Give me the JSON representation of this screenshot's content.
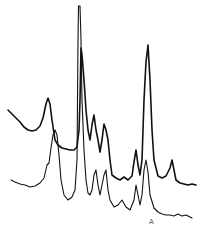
{
  "chart_data": {
    "type": "line",
    "title": "",
    "xlabel": "",
    "ylabel": "",
    "grid": false,
    "legend": null,
    "annotations": [
      {
        "text": "A",
        "x_px": 152,
        "y_px": 224
      }
    ],
    "series": [
      {
        "name": "upper trace",
        "points_px": [
          [
            8,
            110
          ],
          [
            12,
            114
          ],
          [
            16,
            118
          ],
          [
            20,
            122
          ],
          [
            24,
            127
          ],
          [
            28,
            130
          ],
          [
            32,
            131
          ],
          [
            36,
            130
          ],
          [
            40,
            126
          ],
          [
            43,
            118
          ],
          [
            46,
            104
          ],
          [
            48,
            98
          ],
          [
            50,
            104
          ],
          [
            52,
            120
          ],
          [
            55,
            140
          ],
          [
            58,
            145
          ],
          [
            62,
            148
          ],
          [
            66,
            149
          ],
          [
            70,
            150
          ],
          [
            74,
            150
          ],
          [
            77,
            147
          ],
          [
            79,
            130
          ],
          [
            80,
            100
          ],
          [
            81,
            48
          ],
          [
            82,
            55
          ],
          [
            84,
            80
          ],
          [
            86,
            110
          ],
          [
            88,
            130
          ],
          [
            90,
            140
          ],
          [
            92,
            125
          ],
          [
            94,
            115
          ],
          [
            96,
            130
          ],
          [
            98,
            140
          ],
          [
            100,
            152
          ],
          [
            102,
            140
          ],
          [
            104,
            124
          ],
          [
            106,
            130
          ],
          [
            108,
            140
          ],
          [
            110,
            160
          ],
          [
            112,
            175
          ],
          [
            116,
            178
          ],
          [
            120,
            180
          ],
          [
            124,
            177
          ],
          [
            128,
            180
          ],
          [
            132,
            176
          ],
          [
            134,
            162
          ],
          [
            136,
            150
          ],
          [
            138,
            165
          ],
          [
            140,
            175
          ],
          [
            142,
            160
          ],
          [
            144,
            100
          ],
          [
            146,
            62
          ],
          [
            148,
            45
          ],
          [
            150,
            80
          ],
          [
            152,
            130
          ],
          [
            154,
            160
          ],
          [
            158,
            176
          ],
          [
            162,
            178
          ],
          [
            166,
            176
          ],
          [
            170,
            168
          ],
          [
            172,
            160
          ],
          [
            174,
            170
          ],
          [
            176,
            180
          ],
          [
            180,
            183
          ],
          [
            184,
            184
          ],
          [
            188,
            185
          ],
          [
            192,
            184
          ],
          [
            196,
            185
          ]
        ]
      },
      {
        "name": "lower trace",
        "points_px": [
          [
            11,
            180
          ],
          [
            15,
            182
          ],
          [
            20,
            184
          ],
          [
            25,
            185
          ],
          [
            30,
            187
          ],
          [
            35,
            186
          ],
          [
            40,
            183
          ],
          [
            44,
            178
          ],
          [
            47,
            165
          ],
          [
            49,
            163
          ],
          [
            51,
            148
          ],
          [
            53,
            135
          ],
          [
            55,
            130
          ],
          [
            57,
            135
          ],
          [
            59,
            155
          ],
          [
            61,
            180
          ],
          [
            64,
            195
          ],
          [
            68,
            200
          ],
          [
            72,
            197
          ],
          [
            75,
            190
          ],
          [
            77,
            160
          ],
          [
            78,
            40
          ],
          [
            78.5,
            6
          ],
          [
            80,
            6
          ],
          [
            81,
            40
          ],
          [
            82,
            100
          ],
          [
            84,
            150
          ],
          [
            86,
            180
          ],
          [
            88,
            193
          ],
          [
            90,
            195
          ],
          [
            92,
            190
          ],
          [
            94,
            175
          ],
          [
            96,
            170
          ],
          [
            98,
            185
          ],
          [
            100,
            195
          ],
          [
            102,
            185
          ],
          [
            104,
            175
          ],
          [
            106,
            170
          ],
          [
            108,
            190
          ],
          [
            110,
            200
          ],
          [
            114,
            207
          ],
          [
            118,
            205
          ],
          [
            122,
            200
          ],
          [
            126,
            207
          ],
          [
            130,
            210
          ],
          [
            134,
            200
          ],
          [
            136,
            185
          ],
          [
            138,
            195
          ],
          [
            140,
            205
          ],
          [
            142,
            195
          ],
          [
            144,
            170
          ],
          [
            146,
            160
          ],
          [
            148,
            172
          ],
          [
            150,
            195
          ],
          [
            154,
            208
          ],
          [
            158,
            212
          ],
          [
            162,
            214
          ],
          [
            166,
            215
          ],
          [
            170,
            215
          ],
          [
            174,
            216
          ],
          [
            178,
            214
          ],
          [
            182,
            216
          ],
          [
            186,
            215
          ],
          [
            192,
            218
          ]
        ]
      }
    ]
  },
  "labels": {
    "marker": "A"
  }
}
